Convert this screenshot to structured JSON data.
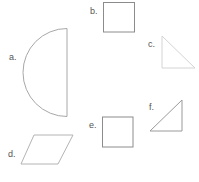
{
  "figure": {
    "shapes": [
      {
        "id": "a",
        "label": "a.",
        "type": "semicircle",
        "stroke": "#a8a8a8"
      },
      {
        "id": "b",
        "label": "b.",
        "type": "square",
        "stroke": "#8c8c8c"
      },
      {
        "id": "c",
        "label": "c.",
        "type": "right-triangle",
        "stroke": "#d4d4d4"
      },
      {
        "id": "d",
        "label": "d.",
        "type": "parallelogram",
        "stroke": "#b4b4b4"
      },
      {
        "id": "e",
        "label": "e.",
        "type": "square",
        "stroke": "#8c8c8c"
      },
      {
        "id": "f",
        "label": "f.",
        "type": "right-triangle",
        "stroke": "#9a9a9a"
      }
    ]
  }
}
